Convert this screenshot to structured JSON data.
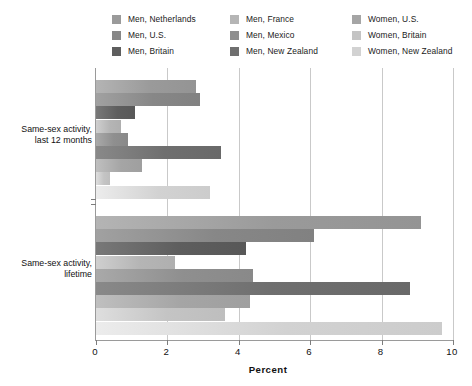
{
  "chart_data": {
    "type": "bar",
    "orientation": "horizontal",
    "title": "",
    "xlabel": "Percent",
    "ylabel": "",
    "xlim": [
      0,
      10
    ],
    "xticks": [
      0,
      2,
      4,
      6,
      8,
      10
    ],
    "xticklabels": [
      "0",
      "2",
      "4",
      "6",
      "8",
      "10"
    ],
    "grid": true,
    "grid_axis": "x",
    "legend_position": "top",
    "legend_columns": 3,
    "categories": [
      "Same-sex activity, last 12 months",
      "Same-sex activity, lifetime"
    ],
    "series": [
      {
        "name": "Men, Netherlands",
        "color": "#9a9a9a",
        "values": [
          2.8,
          9.1
        ]
      },
      {
        "name": "Men, U.S.",
        "color": "#878787",
        "values": [
          2.9,
          6.1
        ]
      },
      {
        "name": "Men, Britain",
        "color": "#5e5e5e",
        "values": [
          1.1,
          4.2
        ]
      },
      {
        "name": "Men, France",
        "color": "#b5b5b5",
        "values": [
          0.7,
          2.2
        ]
      },
      {
        "name": "Men, Mexico",
        "color": "#8f8f8f",
        "values": [
          0.9,
          4.4
        ]
      },
      {
        "name": "Men, New Zealand",
        "color": "#6f6f6f",
        "values": [
          3.5,
          8.8
        ]
      },
      {
        "name": "Women, U.S.",
        "color": "#a5a5a5",
        "values": [
          1.3,
          4.3
        ]
      },
      {
        "name": "Women, Britain",
        "color": "#c4c4c4",
        "values": [
          0.4,
          3.6
        ]
      },
      {
        "name": "Women, New Zealand",
        "color": "#d2d2d2",
        "values": [
          3.2,
          9.7
        ]
      }
    ]
  },
  "legend": {
    "columns": [
      {
        "items": [
          {
            "label": "Men, Netherlands",
            "color": "#9a9a9a"
          },
          {
            "label": "Men, U.S.",
            "color": "#878787"
          },
          {
            "label": "Men, Britain",
            "color": "#5e5e5e"
          }
        ]
      },
      {
        "items": [
          {
            "label": "Men, France",
            "color": "#b5b5b5"
          },
          {
            "label": "Men, Mexico",
            "color": "#8f8f8f"
          },
          {
            "label": "Men, New Zealand",
            "color": "#6f6f6f"
          }
        ]
      },
      {
        "items": [
          {
            "label": "Women, U.S.",
            "color": "#a5a5a5"
          },
          {
            "label": "Women, Britain",
            "color": "#c4c4c4"
          },
          {
            "label": "Women, New Zealand",
            "color": "#d2d2d2"
          }
        ]
      }
    ]
  },
  "axes": {
    "x": {
      "title": "Percent",
      "ticklabels": [
        "0",
        "2",
        "4",
        "6",
        "8",
        "10"
      ]
    },
    "y": {
      "groups": [
        {
          "line1": "Same-sex activity,",
          "line2": "last 12 months"
        },
        {
          "line1": "Same-sex activity,",
          "line2": "lifetime"
        }
      ]
    }
  }
}
